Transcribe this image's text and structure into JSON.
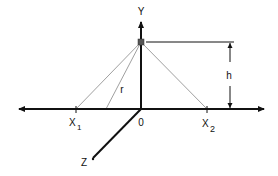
{
  "diagram": {
    "title": "",
    "axes": {
      "x": {
        "label_left": "X",
        "sub_left": "1",
        "label_right": "X",
        "sub_right": "2",
        "origin": "0"
      },
      "y": {
        "label": "Y"
      },
      "z": {
        "label": "Z"
      }
    },
    "annotations": {
      "height_label": "h",
      "radius_label": "r"
    },
    "colors": {
      "axis": "#111111",
      "ray": "#9a9a9a",
      "source": "#555555"
    }
  }
}
